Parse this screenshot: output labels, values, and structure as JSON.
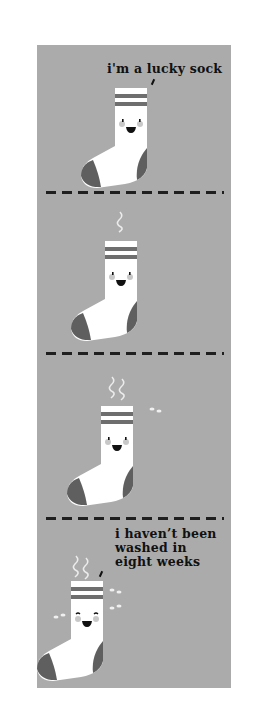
{
  "comic": {
    "panels": [
      {
        "index": 1,
        "caption": "i'm a lucky sock",
        "smell_level": 0,
        "flies": 0
      },
      {
        "index": 2,
        "caption": "",
        "smell_level": 1,
        "flies": 0
      },
      {
        "index": 3,
        "caption": "",
        "smell_level": 2,
        "flies": 1
      },
      {
        "index": 4,
        "caption_lines": [
          "i haven’t been",
          "washed in",
          "eight weeks"
        ],
        "smell_level": 3,
        "flies": 3
      }
    ],
    "colors": {
      "background": "#ababab",
      "sock": "#ffffff",
      "stripe": "#6e6e6e",
      "heel_toe": "#5f5f5f",
      "dash": "#1f1f1f"
    }
  }
}
